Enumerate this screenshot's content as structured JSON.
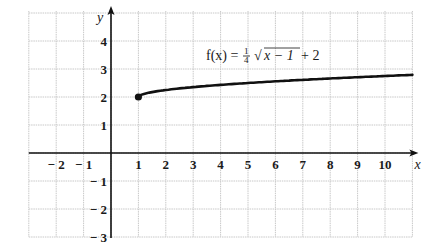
{
  "chart_data": {
    "type": "line",
    "title": "",
    "function_label": "f(x) = 1/4 √(x − 1) + 2",
    "formula": {
      "lhs": "f(x) =",
      "frac_num": "1",
      "frac_den": "4",
      "radical": "√",
      "radicand": "x − 1",
      "tail": "+ 2"
    },
    "xlabel": "x",
    "ylabel": "y",
    "xlim": [
      -3,
      11
    ],
    "ylim": [
      -3,
      5
    ],
    "grid": true,
    "x_ticks": [
      "− 2",
      "− 1",
      "1",
      "2",
      "3",
      "4",
      "5",
      "6",
      "7",
      "8",
      "9",
      "10"
    ],
    "x_tick_values": [
      -2,
      -1,
      1,
      2,
      3,
      4,
      5,
      6,
      7,
      8,
      9,
      10
    ],
    "y_ticks": [
      "4",
      "3",
      "2",
      "1",
      "− 1",
      "− 2",
      "− 3"
    ],
    "y_tick_values": [
      4,
      3,
      2,
      1,
      -1,
      -2,
      -3
    ],
    "series": [
      {
        "name": "f(x) = 1/4 √(x − 1) + 2",
        "x": [
          1,
          2,
          3,
          4,
          5,
          6,
          7,
          8,
          9,
          10,
          11
        ],
        "values": [
          2.0,
          2.25,
          2.354,
          2.433,
          2.5,
          2.559,
          2.612,
          2.661,
          2.707,
          2.75,
          2.791
        ],
        "start_point": {
          "x": 1,
          "y": 2,
          "marker": "closed-dot"
        }
      }
    ]
  }
}
